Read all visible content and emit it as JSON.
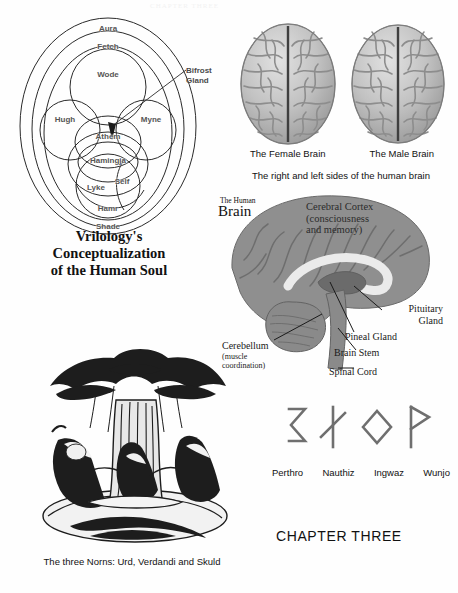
{
  "page": {
    "background": "#fefefe",
    "bleed_text": "CHAPTER THREE"
  },
  "soul_diagram": {
    "title_lines": [
      "Vrilology's",
      "Conceptualization",
      "of the Human Soul"
    ],
    "pointer_label_lines": [
      "Bifrost",
      "Gland"
    ],
    "label_color": "#555555",
    "stroke_color": "#2a2a2a",
    "parts": [
      {
        "name": "Aura",
        "x": 100,
        "y": 14
      },
      {
        "name": "Fetch",
        "x": 100,
        "y": 32
      },
      {
        "name": "Wode",
        "x": 100,
        "y": 60
      },
      {
        "name": "Hugh",
        "x": 57,
        "y": 105
      },
      {
        "name": "Myne",
        "x": 143,
        "y": 105
      },
      {
        "name": "Athem",
        "x": 100,
        "y": 122
      },
      {
        "name": "Hamingja",
        "x": 100,
        "y": 146
      },
      {
        "name": "Lyke",
        "x": 88,
        "y": 173
      },
      {
        "name": "Self",
        "x": 114,
        "y": 167
      },
      {
        "name": "Hamr",
        "x": 100,
        "y": 194
      },
      {
        "name": "Shade",
        "x": 100,
        "y": 212
      }
    ]
  },
  "brain_pair": {
    "left_caption": "The Female Brain",
    "right_caption": "The Male Brain",
    "subcaption": "The right and left sides of the human brain",
    "tissue_color": "#b9b9b9",
    "fissure_color": "#4a4a4a"
  },
  "sagittal_brain": {
    "title_small": "The Human",
    "title_big": "Brain",
    "cortex_overlay_lines": [
      "Cerebral Cortex",
      "(consciousness",
      "and memory)"
    ],
    "tissue_color": "#8f8f8f",
    "callosum_color": "#e8e8e8",
    "labels": [
      {
        "name": "Cerebellum",
        "sub": [
          "(muscle",
          "coordination)"
        ]
      },
      {
        "name": "Pituitary Gland",
        "sub": []
      },
      {
        "name": "Pineal Gland",
        "sub": []
      },
      {
        "name": "Brain Stem",
        "sub": []
      },
      {
        "name": "Spinal Cord",
        "sub": []
      }
    ],
    "pituitary_line_1": "Pituitary",
    "pituitary_line_2": "Gland",
    "pineal": "Pineal Gland",
    "brain_stem": "Brain Stem",
    "spinal_cord": "Spinal Cord",
    "cerebellum": "Cerebellum",
    "cerebellum_sub_1": "(muscle",
    "cerebellum_sub_2": "coordination)"
  },
  "norns": {
    "caption": "The three Norns: Urd, Verdandi and Skuld",
    "ink_color": "#1d1d1d"
  },
  "runes": {
    "stroke_color": "#6f6f6f",
    "items": [
      {
        "name": "Perthro"
      },
      {
        "name": "Nauthiz"
      },
      {
        "name": "Ingwaz"
      },
      {
        "name": "Wunjo"
      }
    ]
  },
  "chapter": {
    "title": "CHAPTER THREE"
  }
}
